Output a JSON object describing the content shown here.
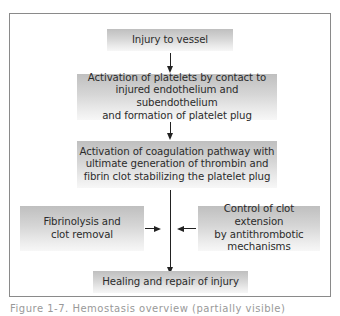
{
  "diagram": {
    "type": "flowchart",
    "nodes": [
      {
        "id": "injury",
        "label": "Injury to vessel"
      },
      {
        "id": "platelets",
        "label": "Activation of platelets by contact to injured endothelium and subendothelium and formation of platelet plug"
      },
      {
        "id": "coagulation",
        "label": "Activation of coagulation pathway with ultimate generation of thrombin and fibrin clot stabilizing the platelet plug"
      },
      {
        "id": "fibrinolysis",
        "label": "Fibrinolysis and clot removal"
      },
      {
        "id": "antithrombotic",
        "label": "Control of clot extension by antithrombotic mechanisms"
      },
      {
        "id": "healing",
        "label": "Healing and repair of injury"
      }
    ],
    "edges": [
      {
        "from": "injury",
        "to": "platelets"
      },
      {
        "from": "platelets",
        "to": "coagulation"
      },
      {
        "from": "coagulation",
        "to": "healing"
      },
      {
        "from": "fibrinolysis",
        "to": "coagulation-healing-line"
      },
      {
        "from": "antithrombotic",
        "to": "coagulation-healing-line"
      }
    ]
  },
  "boxes": {
    "injury": {
      "line1": "Injury to vessel"
    },
    "platelets": {
      "line1": "Activation of platelets by contact to",
      "line2": "injured endothelium and subendothelium",
      "line3": "and formation of platelet plug"
    },
    "coagulation": {
      "line1": "Activation of coagulation pathway with",
      "line2": "ultimate generation of thrombin and",
      "line3": "fibrin clot stabilizing the platelet plug"
    },
    "fibrinolysis": {
      "line1": "Fibrinolysis and",
      "line2": "clot removal"
    },
    "antithrombotic": {
      "line1": "Control of clot extension",
      "line2": "by antithrombotic",
      "line3": "mechanisms"
    },
    "healing": {
      "line1": "Healing and repair of injury"
    }
  },
  "caption": {
    "text": "Figure 1-7. Hemostasis overview (partially visible)"
  }
}
